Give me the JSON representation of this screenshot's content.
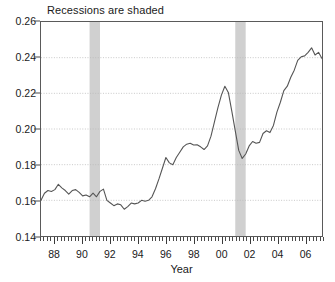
{
  "chart_data": {
    "type": "line",
    "title": "Recessions are shaded",
    "xlabel": "Year",
    "ylabel": "",
    "xlim": [
      1987.0,
      2007.25
    ],
    "ylim": [
      0.14,
      0.26
    ],
    "grid": true,
    "grid_axis": "y",
    "legend": "none",
    "annotations": [
      "Recessions are shaded"
    ],
    "y_ticks": [
      0.14,
      0.16,
      0.18,
      0.2,
      0.22,
      0.24,
      0.26
    ],
    "y_tick_labels": [
      "0.14",
      "0.16",
      "0.18",
      "0.20",
      "0.22",
      "0.24",
      "0.26"
    ],
    "x_ticks": [
      1988,
      1990,
      1992,
      1994,
      1996,
      1998,
      2000,
      2002,
      2004,
      2006
    ],
    "x_tick_labels": [
      "88",
      "90",
      "92",
      "94",
      "96",
      "98",
      "00",
      "02",
      "04",
      "06"
    ],
    "x_minor_tick_step": 0.25,
    "line_color": "#555555",
    "line_width": 1.1,
    "shaded_band_color": "#d0d0d0",
    "grid_color": "#b9b9b9",
    "axis_color": "#5a5a5a",
    "shaded_regions": [
      {
        "label": "recession-1990",
        "start": 1990.5,
        "end": 1991.25
      },
      {
        "label": "recession-2001",
        "start": 2001.0,
        "end": 2001.75
      }
    ],
    "series": [
      {
        "name": "ratio",
        "x": [
          1987.0,
          1987.25,
          1987.5,
          1987.75,
          1988.0,
          1988.25,
          1988.5,
          1988.75,
          1989.0,
          1989.25,
          1989.5,
          1989.75,
          1990.0,
          1990.25,
          1990.5,
          1990.75,
          1991.0,
          1991.25,
          1991.5,
          1991.75,
          1992.0,
          1992.25,
          1992.5,
          1992.75,
          1993.0,
          1993.25,
          1993.5,
          1993.75,
          1994.0,
          1994.25,
          1994.5,
          1994.75,
          1995.0,
          1995.25,
          1995.5,
          1995.75,
          1996.0,
          1996.25,
          1996.5,
          1996.75,
          1997.0,
          1997.25,
          1997.5,
          1997.75,
          1998.0,
          1998.25,
          1998.5,
          1998.75,
          1999.0,
          1999.25,
          1999.5,
          1999.75,
          2000.0,
          2000.25,
          2000.5,
          2000.75,
          2001.0,
          2001.25,
          2001.5,
          2001.75,
          2002.0,
          2002.25,
          2002.5,
          2002.75,
          2003.0,
          2003.25,
          2003.5,
          2003.75,
          2004.0,
          2004.25,
          2004.5,
          2004.75,
          2005.0,
          2005.25,
          2005.5,
          2005.75,
          2006.0,
          2006.25,
          2006.5,
          2006.75,
          2007.0,
          2007.25
        ],
        "y": [
          0.16,
          0.164,
          0.1655,
          0.165,
          0.166,
          0.169,
          0.167,
          0.1655,
          0.1635,
          0.1655,
          0.166,
          0.1645,
          0.1625,
          0.163,
          0.162,
          0.164,
          0.162,
          0.165,
          0.1663,
          0.16,
          0.1585,
          0.157,
          0.158,
          0.1575,
          0.155,
          0.1565,
          0.1585,
          0.158,
          0.1585,
          0.16,
          0.1595,
          0.16,
          0.162,
          0.1665,
          0.172,
          0.178,
          0.184,
          0.181,
          0.18,
          0.184,
          0.187,
          0.19,
          0.1915,
          0.192,
          0.191,
          0.1912,
          0.19,
          0.1885,
          0.1905,
          0.196,
          0.204,
          0.212,
          0.219,
          0.224,
          0.2205,
          0.21,
          0.199,
          0.188,
          0.1835,
          0.186,
          0.1905,
          0.193,
          0.192,
          0.1925,
          0.1975,
          0.199,
          0.198,
          0.202,
          0.2095,
          0.215,
          0.2215,
          0.224,
          0.229,
          0.233,
          0.2385,
          0.2405,
          0.241,
          0.243,
          0.2455,
          0.2415,
          0.243,
          0.2395
        ]
      }
    ]
  }
}
